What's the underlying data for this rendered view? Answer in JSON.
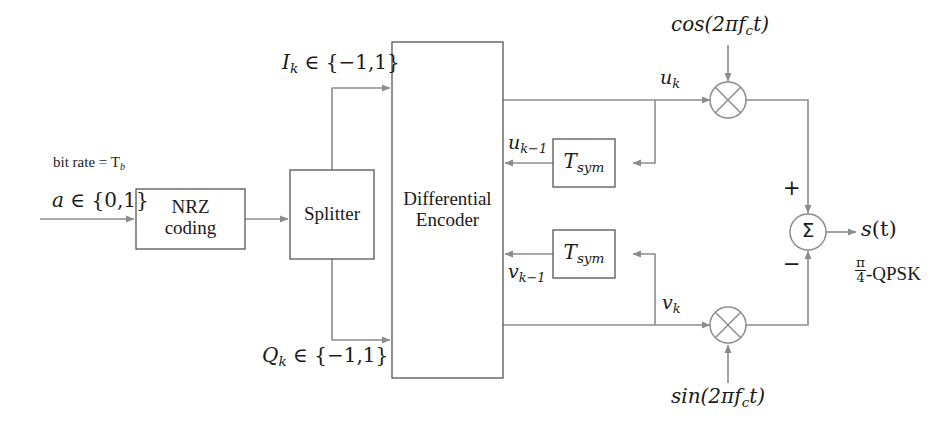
{
  "diagram": {
    "colors": {
      "line": "#8c8c8c",
      "box_stroke": "#555555",
      "text": "#1a1a1a",
      "background": "#ffffff"
    },
    "blocks": [
      {
        "id": "nrz",
        "label_line1": "NRZ",
        "label_line2": "coding"
      },
      {
        "id": "splitter",
        "label_line1": "Splitter",
        "label_line2": ""
      },
      {
        "id": "diff-encoder",
        "label_line1": "Differential",
        "label_line2": "Encoder"
      },
      {
        "id": "delay-upper",
        "label_line1": "T",
        "label_sub": "sym"
      },
      {
        "id": "delay-lower",
        "label_line1": "T",
        "label_sub": "sym"
      }
    ],
    "operators": [
      {
        "id": "mixer-upper",
        "symbol": "multiplier",
        "glyph": "cross-circle"
      },
      {
        "id": "mixer-lower",
        "symbol": "multiplier",
        "glyph": "cross-circle"
      },
      {
        "id": "summer",
        "symbol": "summation",
        "glyph": "sigma-circle",
        "sigma": "Σ",
        "plus": "+",
        "minus": "−"
      }
    ],
    "labels": {
      "bit_rate": {
        "text_plain": "bit rate = T",
        "sub": "b"
      },
      "input_signal": {
        "var": "a",
        "rel": " ∈ {0,1}"
      },
      "i_branch": {
        "var": "I",
        "sub": "k",
        "rel": " ∈ {−1,1}"
      },
      "q_branch": {
        "var": "Q",
        "sub": "k",
        "rel": " ∈ {−1,1}"
      },
      "u_k": {
        "var": "u",
        "sub": "k"
      },
      "u_k_minus_1": {
        "var": "u",
        "sub": "k−1"
      },
      "v_k": {
        "var": "v",
        "sub": "k"
      },
      "v_k_minus_1": {
        "var": "v",
        "sub": "k−1"
      },
      "carrier_cos": {
        "pre": "cos(2πf",
        "sub": "c",
        "post": "t)"
      },
      "carrier_sin": {
        "pre": "sin(2πf",
        "sub": "c",
        "post": "t)"
      },
      "output_signal": {
        "var": "s",
        "post": "(t)"
      },
      "modulation_scheme": {
        "frac_num": "π",
        "frac_den": "4",
        "name": "-QPSK"
      },
      "sum_plus": "+",
      "sum_minus": "−",
      "sigma": "Σ"
    }
  }
}
